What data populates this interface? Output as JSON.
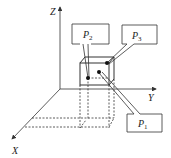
{
  "axes": {
    "x": "X",
    "y": "Y",
    "z": "Z"
  },
  "callouts": {
    "p1": {
      "letter": "P",
      "sub": "1"
    },
    "p2": {
      "letter": "P",
      "sub": "2"
    },
    "p3": {
      "letter": "P",
      "sub": "3"
    }
  },
  "colors": {
    "line": "#333333",
    "background": "#ffffff"
  }
}
